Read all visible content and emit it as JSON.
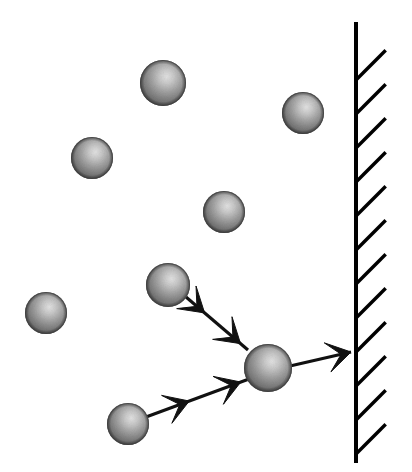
{
  "figure": {
    "canvas": {
      "width": 412,
      "height": 472,
      "background": "#ffffff"
    },
    "colors": {
      "sphere_base": "#8a8a8a",
      "sphere_highlight": "#d6d6d6",
      "sphere_shadow": "#4f4f4f",
      "sphere_edge": "#3d3d3d",
      "stroke": "#111111",
      "wall": "#000000",
      "background": "#ffffff"
    },
    "wall": {
      "name": "container-wall",
      "orientation": "vertical",
      "x": 356,
      "y_top": 22,
      "y_bottom": 463,
      "line_width": 4,
      "hatch": {
        "count": 13,
        "side": "right",
        "angle_deg": -45,
        "length": 42,
        "spacing": 34,
        "line_width": 3.4,
        "first_y": 80
      }
    },
    "spheres": [
      {
        "id": "molecule-1",
        "cx": 163,
        "cy": 83,
        "r": 23,
        "label": "molecule"
      },
      {
        "id": "molecule-2",
        "cx": 303,
        "cy": 113,
        "r": 21,
        "label": "molecule"
      },
      {
        "id": "molecule-3",
        "cx": 92,
        "cy": 158,
        "r": 21,
        "label": "molecule"
      },
      {
        "id": "molecule-4",
        "cx": 224,
        "cy": 212,
        "r": 21,
        "label": "molecule"
      },
      {
        "id": "molecule-5",
        "cx": 168,
        "cy": 285,
        "r": 22,
        "label": "incoming-molecule-upper"
      },
      {
        "id": "molecule-6",
        "cx": 46,
        "cy": 313,
        "r": 21,
        "label": "molecule"
      },
      {
        "id": "molecule-7",
        "cx": 268,
        "cy": 368,
        "r": 24,
        "label": "colliding-molecule"
      },
      {
        "id": "molecule-8",
        "cx": 128,
        "cy": 424,
        "r": 21,
        "label": "incoming-molecule-lower"
      }
    ],
    "arrows": [
      {
        "id": "arrow-incoming-upper",
        "label": "incoming velocity (upper path)",
        "x1": 186,
        "y1": 297,
        "x2": 248,
        "y2": 350,
        "heads": [
          {
            "t": 0.3,
            "direction": "down-right"
          },
          {
            "t": 0.88,
            "direction": "down-right"
          }
        ]
      },
      {
        "id": "arrow-incoming-lower",
        "label": "incoming velocity (lower path)",
        "x1": 146,
        "y1": 417,
        "x2": 249,
        "y2": 379,
        "heads": [
          {
            "t": 0.42,
            "direction": "up-right"
          },
          {
            "t": 0.92,
            "direction": "up-right"
          }
        ]
      },
      {
        "id": "arrow-rebound-to-wall",
        "label": "rebound velocity toward wall",
        "x1": 290,
        "y1": 366,
        "x2": 351,
        "y2": 352,
        "heads": [
          {
            "t": 1.0,
            "direction": "right"
          }
        ]
      }
    ],
    "annotations": {
      "arrowhead_style": "swept-back-barbed",
      "sphere_style": "shaded-3d-ball"
    }
  }
}
